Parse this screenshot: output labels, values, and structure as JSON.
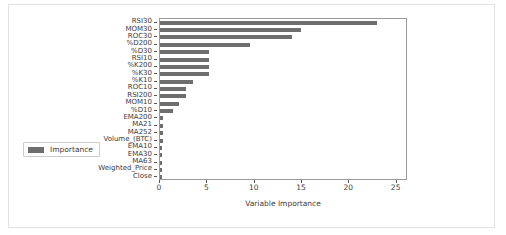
{
  "chart_data": {
    "type": "bar",
    "orientation": "horizontal",
    "title": "",
    "xlabel": "Variable Importance",
    "ylabel": "",
    "xlim": [
      0,
      26.2
    ],
    "xticks": [
      0,
      5,
      10,
      15,
      20,
      25
    ],
    "xtick_labels": [
      "0",
      "5",
      "10",
      "15",
      "20",
      "25"
    ],
    "grid": false,
    "legend": {
      "position": "lower left",
      "entries": [
        {
          "label": "Importance",
          "color": "#6e6e6e"
        }
      ]
    },
    "bar_color": "#6e6e6e",
    "categories": [
      "RSI30",
      "MOM30",
      "ROC30",
      "%D200",
      "%D30",
      "RSI10",
      "%K200",
      "%K30",
      "%K10",
      "ROC10",
      "RSI200",
      "MOM10",
      "%D10",
      "EMA200",
      "MA21",
      "MA252",
      "Volume_(BTC)",
      "EMA10",
      "EMA30",
      "MA63",
      "Weighted_Price",
      "Close"
    ],
    "values": [
      22.9,
      14.9,
      13.9,
      9.5,
      5.2,
      5.2,
      5.2,
      5.2,
      3.5,
      2.7,
      2.7,
      2.0,
      1.4,
      0.3,
      0.3,
      0.3,
      0.3,
      0.25,
      0.25,
      0.25,
      0.2,
      0.2
    ],
    "series": [
      {
        "name": "Importance",
        "values": [
          22.9,
          14.9,
          13.9,
          9.5,
          5.2,
          5.2,
          5.2,
          5.2,
          3.5,
          2.7,
          2.7,
          2.0,
          1.4,
          0.3,
          0.3,
          0.3,
          0.3,
          0.25,
          0.25,
          0.25,
          0.2,
          0.2
        ]
      }
    ]
  },
  "figure": {
    "background_color": "#ffffff",
    "axes_edge_color": "#9a9a9a",
    "text_color": "#3c3c3c"
  }
}
